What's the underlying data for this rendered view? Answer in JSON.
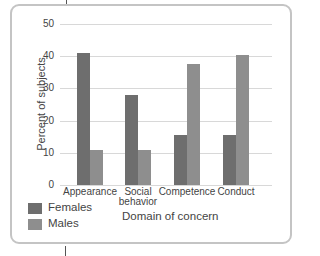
{
  "chart_data": {
    "type": "bar",
    "title": "",
    "xlabel": "Domain of concern",
    "ylabel": "Percent of subjects",
    "ylim": [
      0,
      50
    ],
    "yticks": [
      0,
      10,
      20,
      30,
      40,
      50
    ],
    "grid": true,
    "legend_position": "bottom-left",
    "categories": [
      "Appearance",
      "Social behavior",
      "Competence",
      "Conduct"
    ],
    "series": [
      {
        "name": "Females",
        "color": "#6e6e6e",
        "values": [
          41,
          28,
          15.5,
          15.5
        ]
      },
      {
        "name": "Males",
        "color": "#8e8e8e",
        "values": [
          11,
          11,
          37.5,
          40.5
        ]
      }
    ]
  },
  "axis": {
    "y_ticks": [
      "50",
      "40",
      "30",
      "20",
      "10",
      "0"
    ],
    "y_title": "Percent of subjects",
    "x_title": "Domain of concern",
    "cat_labels": [
      "Appearance",
      "Social\nbehavior",
      "Competence",
      "Conduct"
    ]
  },
  "legend": {
    "females": "Females",
    "males": "Males"
  }
}
